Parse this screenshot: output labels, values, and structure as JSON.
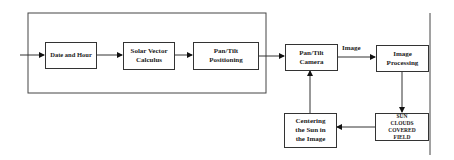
{
  "diagram": {
    "nodes": {
      "date_hour": "Date and Hour",
      "solar_vector": "Solar Vector Calculus",
      "pan_tilt_positioning": "Pan/Tilt Positioning",
      "pan_tilt_camera": "Pan/Tilt Camera",
      "image_processing": "Image Processing",
      "sun_clouds": "SUN CLOUDS COVERED FIELD",
      "centering": "Centering the Sun in the Image"
    },
    "edge_labels": {
      "camera_to_processing": "Image"
    },
    "edges": [
      [
        "input",
        "date_hour"
      ],
      [
        "date_hour",
        "solar_vector"
      ],
      [
        "solar_vector",
        "pan_tilt_positioning"
      ],
      [
        "pan_tilt_positioning",
        "pan_tilt_camera"
      ],
      [
        "pan_tilt_camera",
        "image_processing"
      ],
      [
        "image_processing",
        "sun_clouds"
      ],
      [
        "sun_clouds",
        "centering"
      ],
      [
        "centering",
        "pan_tilt_camera"
      ]
    ]
  }
}
